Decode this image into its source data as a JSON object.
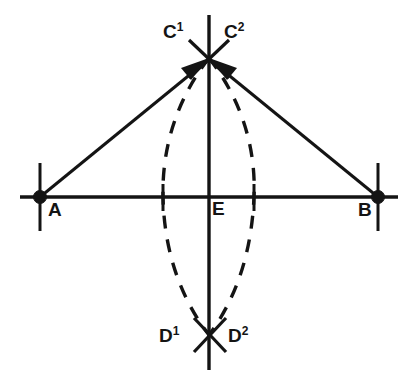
{
  "figure": {
    "background_color": "#ffffff",
    "ink_color": "#141414",
    "width": 410,
    "height": 386
  },
  "labels": {
    "a": "A",
    "b": "B",
    "e": "E",
    "c1_base": "C",
    "c1_sup": "1",
    "c2_base": "C",
    "c2_sup": "2",
    "d1_base": "D",
    "d1_sup": "1",
    "d2_base": "D",
    "d2_sup": "2"
  },
  "geometry": {
    "points": {
      "A": {
        "x": 40,
        "y": 197,
        "marker": "filled-dot"
      },
      "B": {
        "x": 378,
        "y": 197,
        "marker": "filled-dot"
      },
      "E": {
        "x": 209,
        "y": 197,
        "marker": "none"
      },
      "C": {
        "x": 209,
        "y": 58,
        "marker": "cross"
      },
      "D": {
        "x": 209,
        "y": 335,
        "marker": "cross"
      }
    },
    "horizontal_line": {
      "x1": 20,
      "y1": 197,
      "x2": 398,
      "y2": 197,
      "style": "solid"
    },
    "vertical_line": {
      "x1": 209,
      "y1": 15,
      "x2": 209,
      "y2": 370,
      "style": "solid"
    },
    "tick_marks": [
      {
        "name": "tick-at-A",
        "x": 40,
        "y1": 163,
        "y2": 231
      },
      {
        "name": "tick-at-B",
        "x": 378,
        "y1": 163,
        "y2": 231
      },
      {
        "name": "tick-left-arc-crossing",
        "x": 163,
        "y1": 184,
        "y2": 211
      },
      {
        "name": "tick-right-arc-crossing",
        "x": 254,
        "y1": 184,
        "y2": 211
      }
    ],
    "rays": [
      {
        "name": "ray-A-to-C",
        "x1": 40,
        "y1": 197,
        "x2": 209,
        "y2": 58,
        "arrow": "at-end"
      },
      {
        "name": "ray-B-to-C",
        "x1": 378,
        "y1": 197,
        "x2": 209,
        "y2": 58,
        "arrow": "at-end"
      }
    ],
    "arcs": [
      {
        "name": "arc-centered-at-A",
        "from": "C",
        "to": "D",
        "bulge_side": "right",
        "style": "dashed",
        "crosses_axis_at_x": 254
      },
      {
        "name": "arc-centered-at-B",
        "from": "C",
        "to": "D",
        "bulge_side": "left",
        "style": "dashed",
        "crosses_axis_at_x": 163
      }
    ],
    "stroke_widths": {
      "axis": 3.4,
      "ray": 3.0,
      "arc": 3.4,
      "tick": 3.0,
      "cross": 3.2
    },
    "dash_pattern": "13 11"
  }
}
